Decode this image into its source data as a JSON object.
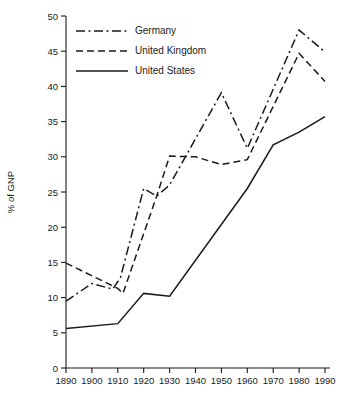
{
  "chart_data": {
    "type": "line",
    "title": "",
    "subtitle": "",
    "xlabel": "",
    "ylabel": "% of GNP",
    "xlim": [
      1890,
      1990
    ],
    "ylim": [
      0,
      50
    ],
    "grid": false,
    "legend_position": "top-left",
    "x": [
      1890,
      1900,
      1910,
      1920,
      1930,
      1940,
      1950,
      1960,
      1970,
      1980,
      1990
    ],
    "xticklabels": [
      "1890",
      "1900",
      "1910",
      "1920",
      "1930",
      "1940",
      "1950",
      "1960",
      "1970",
      "1980",
      "1990"
    ],
    "yticks": [
      0,
      5,
      10,
      15,
      20,
      25,
      30,
      35,
      40,
      45,
      50
    ],
    "yticklabels": [
      "0",
      "5",
      "10",
      "15",
      "20",
      "25",
      "30",
      "35",
      "40",
      "45",
      "50"
    ],
    "series": [
      {
        "name": "Germany",
        "style": "dash-dot",
        "color": "#1a1a1a",
        "x": [
          1890,
          1900,
          1908,
          1911,
          1920,
          1925,
          1930,
          1950,
          1960,
          1980,
          1990
        ],
        "values": [
          9.5,
          12.0,
          11.2,
          12.8,
          25.5,
          24.4,
          26.0,
          39.1,
          31.2,
          48.0,
          44.9
        ]
      },
      {
        "name": "United Kingdom",
        "style": "dashed",
        "color": "#1a1a1a",
        "x": [
          1890,
          1910,
          1912,
          1925,
          1930,
          1940,
          1950,
          1960,
          1980,
          1990
        ],
        "values": [
          14.9,
          11.3,
          10.6,
          24.4,
          30.1,
          30.0,
          28.9,
          29.6,
          44.7,
          40.7
        ]
      },
      {
        "name": "United States",
        "style": "solid",
        "color": "#1a1a1a",
        "x": [
          1890,
          1910,
          1920,
          1930,
          1960,
          1970,
          1980,
          1990
        ],
        "values": [
          5.6,
          6.3,
          10.6,
          10.2,
          25.5,
          31.7,
          33.5,
          35.7
        ]
      }
    ],
    "legend": [
      {
        "label": "Germany",
        "style": "dash-dot"
      },
      {
        "label": "United Kingdom",
        "style": "dashed"
      },
      {
        "label": "United States",
        "style": "solid"
      }
    ]
  }
}
